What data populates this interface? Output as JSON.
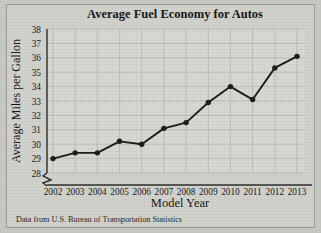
{
  "chart_data": {
    "type": "line",
    "title": "Average Fuel Economy for Autos",
    "xlabel": "Model Year",
    "ylabel": "Average Miles per Gallon",
    "source_note": "Data from U.S. Bureau of Transportation Statistics",
    "categories": [
      "2002",
      "2003",
      "2004",
      "2005",
      "2006",
      "2007",
      "2008",
      "2009",
      "2010",
      "2011",
      "2012",
      "2013"
    ],
    "values": [
      29.0,
      29.4,
      29.4,
      30.2,
      30.0,
      31.1,
      31.5,
      32.9,
      34.0,
      33.1,
      35.3,
      36.1
    ],
    "x": [
      2002,
      2003,
      2004,
      2005,
      2006,
      2007,
      2008,
      2009,
      2010,
      2011,
      2012,
      2013
    ],
    "ylim": [
      28,
      38
    ],
    "yticks": [
      28,
      29,
      30,
      31,
      32,
      33,
      34,
      35,
      36,
      37,
      38
    ],
    "ytick_labels": [
      "28",
      "29",
      "30",
      "31",
      "32",
      "33",
      "34",
      "35",
      "36",
      "37",
      "38"
    ],
    "xlim": [
      2002,
      2013
    ],
    "grid": true,
    "legend": false,
    "axis_break": true,
    "marker": "filled-circle",
    "line_color": "#1a1a1a",
    "marker_color": "#1a1a1a",
    "grid_color": "#b8b8b3",
    "plot_background": "#d8d8d3",
    "figure_background": "#d2d2cd"
  }
}
